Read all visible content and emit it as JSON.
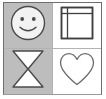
{
  "panel": {
    "name": "icon-grid",
    "columns": 2,
    "rows": 2,
    "border_color": "#6e6e6e",
    "divider_color": "#b3b3b3",
    "background": "#ffffff"
  },
  "cells": [
    {
      "position": "top-left",
      "icon": "smiley-face-icon",
      "label": "Smiley face",
      "background": "#bdbdbd",
      "shaded": true,
      "stroke": "#4a4a4a",
      "fill": "#f2f2f2"
    },
    {
      "position": "top-right",
      "icon": "framed-square-icon",
      "label": "Framed square",
      "background": "#ffffff",
      "shaded": false,
      "stroke": "#3f3f3f",
      "fill": "#c9c9c9"
    },
    {
      "position": "bottom-left",
      "icon": "hourglass-icon",
      "label": "Hourglass",
      "background": "#bdbdbd",
      "shaded": true,
      "stroke": "#4a4a4a",
      "fill": "#ffffff"
    },
    {
      "position": "bottom-right",
      "icon": "heart-icon",
      "label": "Heart",
      "background": "#ffffff",
      "shaded": false,
      "stroke": "#6a6a6a",
      "fill": "none"
    }
  ]
}
